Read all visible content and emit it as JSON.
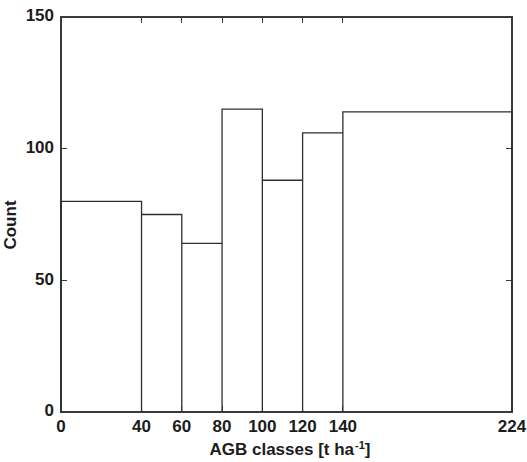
{
  "chart_data": {
    "type": "bar",
    "title": "",
    "subtitle": "",
    "xlabel": "AGB classes [t ha -1]",
    "xlabel_base": "AGB classes [t ha",
    "xlabel_superscript": "-1",
    "xlabel_suffix": "]",
    "ylabel": "Count",
    "xlim": [
      0,
      224
    ],
    "ylim": [
      0,
      150
    ],
    "grid": false,
    "legend": null,
    "x_ticks": [
      0,
      40,
      60,
      80,
      100,
      120,
      140,
      224
    ],
    "x_tick_labels": [
      "0",
      "40",
      "60",
      "80",
      "100",
      "120",
      "140",
      "224"
    ],
    "y_ticks": [
      0,
      50,
      100,
      150
    ],
    "y_tick_labels": [
      "0",
      "50",
      "100",
      "150"
    ],
    "bin_edges": [
      0,
      40,
      60,
      80,
      100,
      120,
      140,
      224
    ],
    "categories": [
      "0-40",
      "40-60",
      "60-80",
      "80-100",
      "100-120",
      "120-140",
      "140-224"
    ],
    "values": [
      80,
      75,
      64,
      115,
      88,
      106,
      114
    ],
    "bar_fill": "#ffffff",
    "bar_stroke": "#2e2e2e",
    "background": "#ffffff",
    "axis_color": "#3a3a3a"
  },
  "figure": {
    "name": "AGB classes histogram"
  }
}
